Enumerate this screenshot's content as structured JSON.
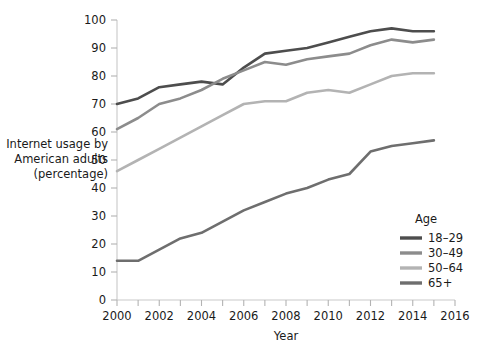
{
  "chart_data": {
    "type": "line",
    "title": "",
    "xlabel": "Year",
    "ylabel": "Internet usage by American adults (percentage)",
    "ylabel_lines": [
      "Internet usage by",
      "American adults",
      "(percentage)"
    ],
    "xlim": [
      2000,
      2016
    ],
    "ylim": [
      0,
      100
    ],
    "xticks": [
      2000,
      2001,
      2002,
      2003,
      2004,
      2005,
      2006,
      2007,
      2008,
      2009,
      2010,
      2011,
      2012,
      2013,
      2014,
      2015,
      2016
    ],
    "xtick_labels": [
      "2000",
      "",
      "2002",
      "",
      "2004",
      "",
      "2006",
      "",
      "2008",
      "",
      "2010",
      "",
      "2012",
      "",
      "2014",
      "",
      "2016"
    ],
    "yticks": [
      0,
      10,
      20,
      30,
      40,
      50,
      60,
      70,
      80,
      90,
      100
    ],
    "ytick_labels": [
      "0",
      "10",
      "20",
      "30",
      "40",
      "50",
      "60",
      "70",
      "80",
      "90",
      "100"
    ],
    "grid": false,
    "legend_position": "right-bottom",
    "legend_title": "Age",
    "x": [
      2000,
      2001,
      2002,
      2003,
      2004,
      2005,
      2006,
      2007,
      2008,
      2009,
      2010,
      2011,
      2012,
      2013,
      2014,
      2015
    ],
    "series": [
      {
        "name": "18–29",
        "color": "#4d4d4d",
        "values": [
          70,
          72,
          76,
          77,
          78,
          77,
          83,
          88,
          89,
          90,
          92,
          94,
          96,
          97,
          96,
          96
        ]
      },
      {
        "name": "30–49",
        "color": "#8c8c8c",
        "values": [
          61,
          65,
          70,
          72,
          75,
          79,
          82,
          85,
          84,
          86,
          87,
          88,
          91,
          93,
          92,
          93
        ]
      },
      {
        "name": "50–64",
        "color": "#b3b3b3",
        "values": [
          46,
          50,
          54,
          58,
          62,
          66,
          70,
          71,
          71,
          74,
          75,
          74,
          77,
          80,
          81,
          81
        ]
      },
      {
        "name": "65+",
        "color": "#6e6e6e",
        "values": [
          14,
          14,
          18,
          22,
          24,
          28,
          32,
          35,
          38,
          40,
          43,
          45,
          53,
          55,
          56,
          57
        ]
      }
    ]
  },
  "legend": {
    "title": "Age",
    "items": [
      {
        "label": "18–29",
        "color": "#4d4d4d"
      },
      {
        "label": "30–49",
        "color": "#8c8c8c"
      },
      {
        "label": "50–64",
        "color": "#b3b3b3"
      },
      {
        "label": "65+",
        "color": "#6e6e6e"
      }
    ]
  },
  "colors": {
    "background": "#ffffff",
    "axis": "#c9c9c9",
    "text": "#1a1a1a"
  }
}
